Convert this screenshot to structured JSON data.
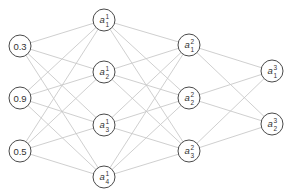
{
  "diagram": {
    "type": "fully-connected-neural-network",
    "colors": {
      "edge": "#c9c9c9",
      "node_stroke": "#4a4a4a",
      "node_fill": "#ffffff",
      "text": "#333333"
    },
    "node_radius": 11,
    "layers": [
      {
        "name": "input",
        "nodes": [
          {
            "id": "in1",
            "label": "0.3",
            "x": 20,
            "y": 46
          },
          {
            "id": "in2",
            "label": "0.9",
            "x": 20,
            "y": 98
          },
          {
            "id": "in3",
            "label": "0.5",
            "x": 20,
            "y": 151
          }
        ]
      },
      {
        "name": "hidden-1",
        "nodes": [
          {
            "id": "h1_1",
            "var": "a",
            "sup": "1",
            "sub": "1",
            "x": 104,
            "y": 20
          },
          {
            "id": "h1_2",
            "var": "a",
            "sup": "1",
            "sub": "2",
            "x": 104,
            "y": 72
          },
          {
            "id": "h1_3",
            "var": "a",
            "sup": "1",
            "sub": "3",
            "x": 104,
            "y": 125
          },
          {
            "id": "h1_4",
            "var": "a",
            "sup": "1",
            "sub": "4",
            "x": 104,
            "y": 177
          }
        ]
      },
      {
        "name": "hidden-2",
        "nodes": [
          {
            "id": "h2_1",
            "var": "a",
            "sup": "2",
            "sub": "1",
            "x": 189,
            "y": 45
          },
          {
            "id": "h2_2",
            "var": "a",
            "sup": "2",
            "sub": "2",
            "x": 189,
            "y": 98
          },
          {
            "id": "h2_3",
            "var": "a",
            "sup": "2",
            "sub": "3",
            "x": 189,
            "y": 151
          }
        ]
      },
      {
        "name": "output",
        "nodes": [
          {
            "id": "out1",
            "var": "a",
            "sup": "3",
            "sub": "1",
            "x": 272,
            "y": 71
          },
          {
            "id": "out2",
            "var": "a",
            "sup": "3",
            "sub": "2",
            "x": 272,
            "y": 124
          }
        ]
      }
    ]
  }
}
